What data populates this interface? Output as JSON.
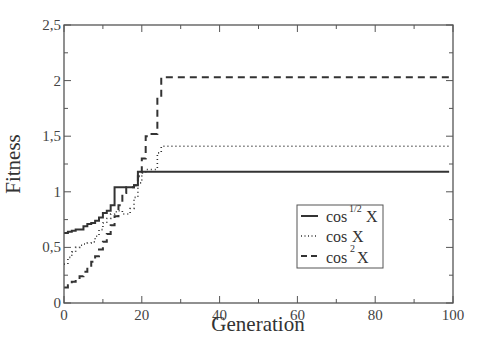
{
  "chart_data": {
    "type": "line",
    "title": "",
    "xlabel": "Generation",
    "ylabel": "Fitness",
    "xlim": [
      0,
      100
    ],
    "ylim": [
      0,
      2.5
    ],
    "xticks": [
      0,
      20,
      40,
      60,
      80,
      100
    ],
    "xtick_labels": [
      "0",
      "20",
      "40",
      "60",
      "80",
      "100"
    ],
    "yticks": [
      0,
      0.5,
      1,
      1.5,
      2,
      2.5
    ],
    "ytick_labels": [
      "0",
      "0,5",
      "1",
      "1,5",
      "2",
      "2,5"
    ],
    "grid": false,
    "legend_position": "lower right (inside)",
    "series": [
      {
        "name": "cos^{1/2} X",
        "legend_base": "cos",
        "legend_sup": "1/2",
        "legend_var": "X",
        "style": "solid",
        "x": [
          0,
          1,
          2,
          3,
          4,
          5,
          6,
          7,
          8,
          9,
          10,
          11,
          12,
          13,
          14,
          15,
          16,
          17,
          18,
          19,
          20,
          25,
          40,
          60,
          80,
          99
        ],
        "y": [
          0.63,
          0.64,
          0.65,
          0.66,
          0.66,
          0.69,
          0.71,
          0.72,
          0.74,
          0.77,
          0.81,
          0.83,
          0.88,
          1.04,
          1.04,
          1.04,
          1.04,
          1.04,
          1.06,
          1.18,
          1.18,
          1.18,
          1.18,
          1.18,
          1.18,
          1.18
        ]
      },
      {
        "name": "cos X",
        "legend_base": "cos",
        "legend_sup": "",
        "legend_var": "X",
        "style": "dotted",
        "x": [
          0,
          1,
          2,
          3,
          4,
          5,
          6,
          7,
          8,
          9,
          10,
          11,
          12,
          13,
          14,
          15,
          16,
          17,
          18,
          19,
          20,
          21,
          22,
          23,
          24,
          25,
          40,
          60,
          80,
          99
        ],
        "y": [
          0.35,
          0.41,
          0.46,
          0.5,
          0.52,
          0.53,
          0.54,
          0.55,
          0.6,
          0.66,
          0.72,
          0.76,
          0.8,
          0.82,
          0.83,
          0.8,
          0.8,
          0.85,
          0.95,
          1.08,
          1.17,
          1.2,
          1.2,
          1.2,
          1.35,
          1.41,
          1.41,
          1.41,
          1.41,
          1.41
        ]
      },
      {
        "name": "cos^2 X",
        "legend_base": "cos",
        "legend_sup": "2",
        "legend_var": "X",
        "style": "dashed",
        "x": [
          0,
          1,
          2,
          3,
          4,
          5,
          6,
          7,
          8,
          9,
          10,
          11,
          12,
          13,
          14,
          15,
          16,
          17,
          18,
          19,
          20,
          21,
          22,
          23,
          24,
          25,
          40,
          60,
          80,
          99
        ],
        "y": [
          0.14,
          0.16,
          0.19,
          0.21,
          0.24,
          0.28,
          0.32,
          0.37,
          0.42,
          0.48,
          0.55,
          0.62,
          0.7,
          0.78,
          0.88,
          0.99,
          1.04,
          1.04,
          1.06,
          1.14,
          1.3,
          1.5,
          1.52,
          1.52,
          1.85,
          2.03,
          2.03,
          2.03,
          2.03,
          2.03
        ]
      }
    ]
  },
  "colors": {
    "axis": "#555555",
    "line": "#333333",
    "background": "#ffffff"
  }
}
